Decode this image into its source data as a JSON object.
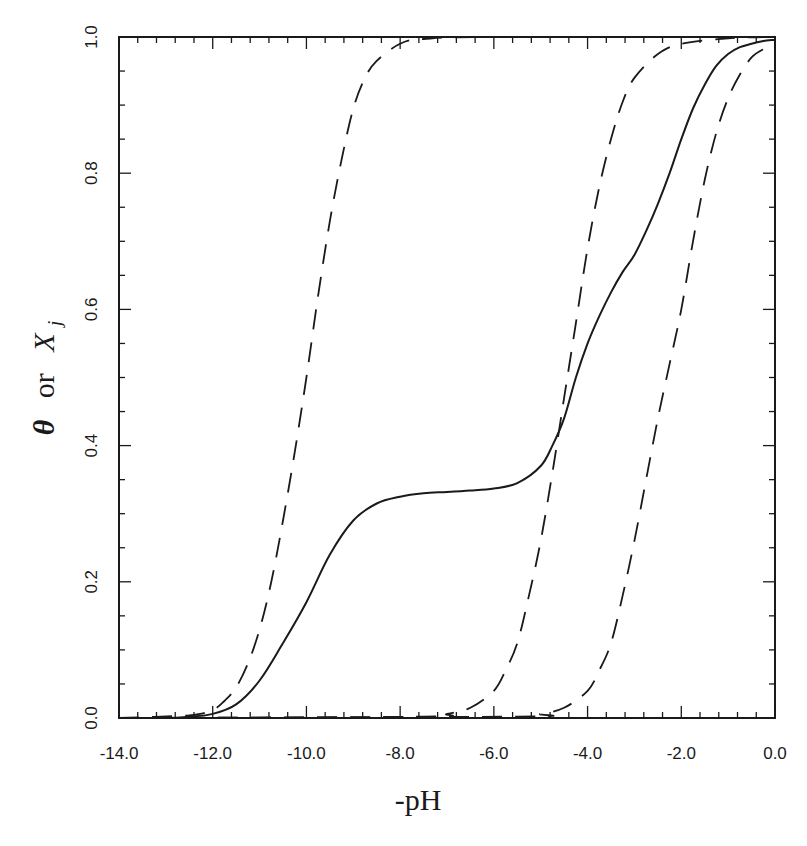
{
  "chart_data": {
    "type": "line",
    "title": "",
    "xlabel": "-pH",
    "ylabel": "θ or X_j",
    "ylabel_parts": {
      "theta": "θ",
      "or": "or",
      "x": "X",
      "sub": "j"
    },
    "xlim": [
      -14.0,
      0.0
    ],
    "ylim": [
      0.0,
      1.0
    ],
    "grid": false,
    "legend": null,
    "x_ticks": [
      -14.0,
      -12.0,
      -10.0,
      -8.0,
      -6.0,
      -4.0,
      -2.0,
      0.0
    ],
    "x_tick_labels": [
      "-14.0",
      "-12.0",
      "-10.0",
      "-8.0",
      "-6.0",
      "-4.0",
      "-2.0",
      "0.0"
    ],
    "x_minor_step": 0.4,
    "y_ticks": [
      0.0,
      0.2,
      0.4,
      0.6,
      0.8,
      1.0
    ],
    "y_tick_labels": [
      "0.0",
      "0.2",
      "0.4",
      "0.6",
      "0.8",
      "1.0"
    ],
    "y_minor_step": 0.05,
    "series": [
      {
        "name": "theta (overall, solid)",
        "style": "solid",
        "x": [
          -14.0,
          -13.0,
          -12.5,
          -12.0,
          -11.5,
          -11.0,
          -10.5,
          -10.0,
          -9.5,
          -9.0,
          -8.5,
          -8.0,
          -7.5,
          -7.0,
          -6.5,
          -6.0,
          -5.5,
          -5.0,
          -4.75,
          -4.5,
          -4.25,
          -4.0,
          -3.75,
          -3.5,
          -3.25,
          -3.0,
          -2.75,
          -2.5,
          -2.25,
          -2.0,
          -1.75,
          -1.5,
          -1.25,
          -1.0,
          -0.75,
          -0.5,
          -0.25,
          0.0
        ],
        "y": [
          0.0,
          0.0,
          0.002,
          0.006,
          0.02,
          0.055,
          0.11,
          0.17,
          0.24,
          0.29,
          0.315,
          0.325,
          0.33,
          0.332,
          0.334,
          0.337,
          0.345,
          0.37,
          0.4,
          0.44,
          0.5,
          0.55,
          0.59,
          0.625,
          0.655,
          0.68,
          0.715,
          0.755,
          0.8,
          0.85,
          0.895,
          0.93,
          0.958,
          0.975,
          0.985,
          0.99,
          0.994,
          0.996
        ]
      },
      {
        "name": "X_1 (dashed)",
        "style": "dashed",
        "x": [
          -14.0,
          -12.5,
          -12.0,
          -11.75,
          -11.5,
          -11.25,
          -11.0,
          -10.75,
          -10.5,
          -10.25,
          -10.0,
          -9.75,
          -9.5,
          -9.25,
          -9.0,
          -8.75,
          -8.5,
          -8.0,
          -7.5,
          -6.0,
          0.0
        ],
        "y": [
          0.0,
          0.004,
          0.012,
          0.025,
          0.045,
          0.08,
          0.13,
          0.2,
          0.29,
          0.39,
          0.5,
          0.62,
          0.73,
          0.82,
          0.895,
          0.94,
          0.965,
          0.99,
          0.997,
          1.0,
          1.0
        ]
      },
      {
        "name": "X_2 (dashed)",
        "style": "dashed",
        "x": [
          -14.0,
          -7.5,
          -7.0,
          -6.5,
          -6.0,
          -5.75,
          -5.5,
          -5.25,
          -5.0,
          -4.75,
          -4.5,
          -4.25,
          -4.0,
          -3.75,
          -3.5,
          -3.25,
          -3.0,
          -2.5,
          -2.0,
          -1.0,
          0.0
        ],
        "y": [
          0.0,
          0.002,
          0.006,
          0.015,
          0.04,
          0.07,
          0.11,
          0.18,
          0.26,
          0.36,
          0.47,
          0.58,
          0.69,
          0.78,
          0.85,
          0.905,
          0.94,
          0.975,
          0.99,
          0.998,
          1.0
        ]
      },
      {
        "name": "X_3 (dashed)",
        "style": "dashed",
        "x": [
          -14.0,
          -5.5,
          -5.0,
          -4.5,
          -4.0,
          -3.75,
          -3.5,
          -3.25,
          -3.0,
          -2.75,
          -2.5,
          -2.25,
          -2.0,
          -1.75,
          -1.5,
          -1.25,
          -1.0,
          -0.75,
          -0.5,
          -0.25,
          0.0
        ],
        "y": [
          0.0,
          0.002,
          0.006,
          0.015,
          0.04,
          0.07,
          0.11,
          0.18,
          0.26,
          0.35,
          0.44,
          0.52,
          0.6,
          0.7,
          0.79,
          0.86,
          0.91,
          0.945,
          0.97,
          0.982,
          0.988
        ]
      }
    ]
  },
  "plot_area": {
    "left": 119,
    "top": 37,
    "right": 775,
    "bottom": 718
  },
  "colors": {
    "ink": "#1a1a1a",
    "background": "#ffffff"
  }
}
